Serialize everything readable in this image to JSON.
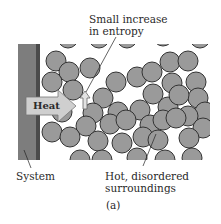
{
  "figure": {
    "panel_label": "(a)",
    "labels": {
      "entropy_line1": "Small increase",
      "entropy_line2": "in entropy",
      "system": "System",
      "surroundings_line1": "Hot, disordered",
      "surroundings_line2": "surroundings",
      "heat": "Heat"
    },
    "colors": {
      "system_fill": "#7d7d7d",
      "system_edge": "#4a4a4a",
      "particle_fill": "#9a9a9a",
      "particle_stroke": "#333333",
      "arrow_fill": "#cfcfcf"
    }
  }
}
